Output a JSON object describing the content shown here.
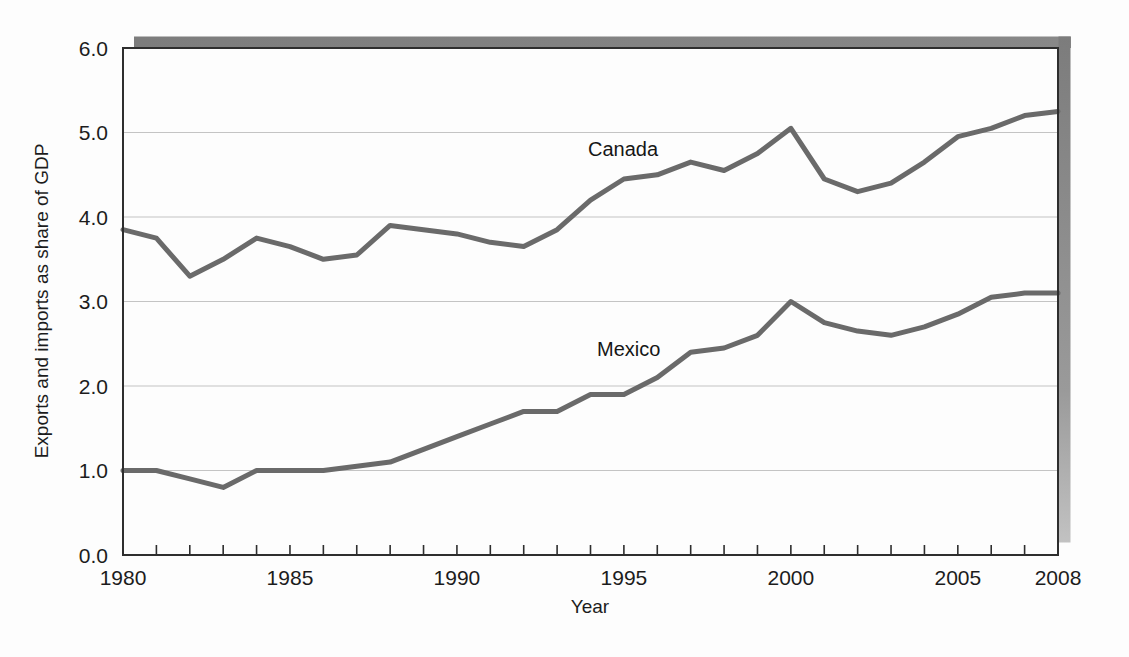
{
  "figure": {
    "kind": "scanned textbook line chart",
    "background_color": "#fdfdfd",
    "frame_color": "#2e2e2e",
    "gridline_color": "#c4c4c4",
    "shadow_color_dark": "#7f7f7f",
    "shadow_color_light": "#bdbdbd",
    "text_color": "#1c1c1c"
  },
  "chart_data": {
    "type": "line",
    "title": "",
    "xlabel": "Year",
    "ylabel": "Exports and imports as share of GDP",
    "xlim": [
      1980,
      2008
    ],
    "ylim": [
      0,
      6
    ],
    "grid": "horizontal gridlines at 1.0 through 5.0",
    "legend_position": "inline labels next to each line",
    "x": [
      1980,
      1981,
      1982,
      1983,
      1984,
      1985,
      1986,
      1987,
      1988,
      1989,
      1990,
      1991,
      1992,
      1993,
      1994,
      1995,
      1996,
      1997,
      1998,
      1999,
      2000,
      2001,
      2002,
      2003,
      2004,
      2005,
      2006,
      2007,
      2008
    ],
    "series": [
      {
        "name": "Canada",
        "color": "#6a6a6a",
        "values": [
          3.85,
          3.75,
          3.3,
          3.5,
          3.75,
          3.65,
          3.5,
          3.55,
          3.9,
          3.85,
          3.8,
          3.7,
          3.65,
          3.85,
          4.2,
          4.45,
          4.5,
          4.65,
          4.55,
          4.75,
          5.05,
          4.45,
          4.3,
          4.4,
          4.65,
          4.95,
          5.05,
          5.2,
          5.25
        ]
      },
      {
        "name": "Mexico",
        "color": "#6a6a6a",
        "values": [
          1.0,
          1.0,
          0.9,
          0.8,
          1.0,
          1.0,
          1.0,
          1.05,
          1.1,
          1.25,
          1.4,
          1.55,
          1.7,
          1.7,
          1.9,
          1.9,
          2.1,
          2.4,
          2.45,
          2.6,
          3.0,
          2.75,
          2.65,
          2.6,
          2.7,
          2.85,
          3.05,
          3.1,
          3.1
        ]
      }
    ],
    "x_ticks": [
      {
        "value": 1980,
        "label": "1980"
      },
      {
        "value": 1985,
        "label": "1985"
      },
      {
        "value": 1990,
        "label": "1990"
      },
      {
        "value": 1995,
        "label": "1995"
      },
      {
        "value": 2000,
        "label": "2000"
      },
      {
        "value": 2005,
        "label": "2005"
      },
      {
        "value": 2008,
        "label": "2008"
      }
    ],
    "minor_x_tick_every_year": true,
    "y_ticks": [
      {
        "value": 0,
        "label": "0.0"
      },
      {
        "value": 1,
        "label": "1.0"
      },
      {
        "value": 2,
        "label": "2.0"
      },
      {
        "value": 3,
        "label": "3.0"
      },
      {
        "value": 4,
        "label": "4.0"
      },
      {
        "value": 5,
        "label": "5.0"
      },
      {
        "value": 6,
        "label": "6.0"
      }
    ]
  }
}
